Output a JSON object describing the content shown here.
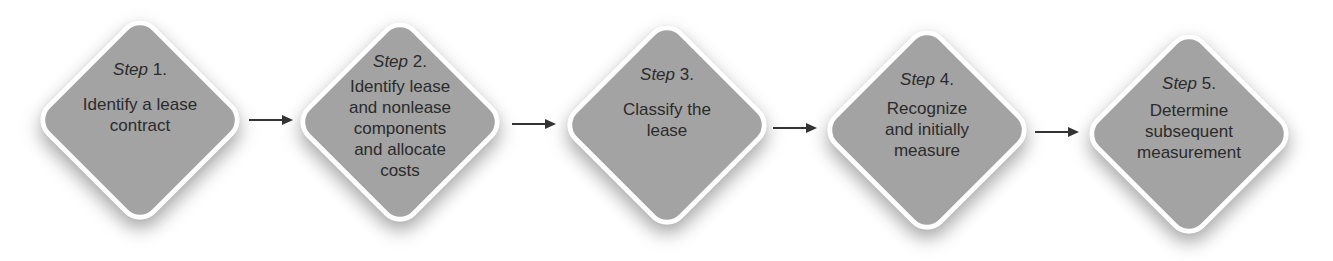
{
  "diagram": {
    "type": "process-flow",
    "steps": [
      {
        "label_word": "Step",
        "label_num": " 1.",
        "text": "Identify a lease\ncontract"
      },
      {
        "label_word": "Step",
        "label_num": " 2.",
        "text": "Identify lease\nand nonlease\ncomponents\nand allocate\ncosts"
      },
      {
        "label_word": "Step",
        "label_num": " 3.",
        "text": "Classify the\nlease"
      },
      {
        "label_word": "Step",
        "label_num": " 4.",
        "text": "Recognize\nand initially\nmeasure"
      },
      {
        "label_word": "Step",
        "label_num": " 5.",
        "text": "Determine\nsubsequent\nmeasurement"
      }
    ],
    "connectors": [
      {
        "from": 1,
        "to": 2
      },
      {
        "from": 2,
        "to": 3
      },
      {
        "from": 3,
        "to": 4
      },
      {
        "from": 4,
        "to": 5
      }
    ],
    "colors": {
      "fill": "#a3a3a3",
      "border": "#ffffff",
      "text": "#2b2b2b",
      "arrow": "#333333"
    }
  }
}
